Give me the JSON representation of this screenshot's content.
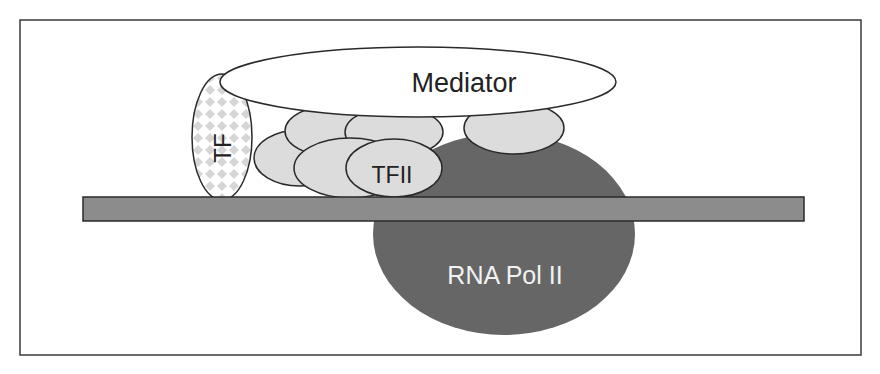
{
  "diagram": {
    "labels": {
      "mediator": "Mediator",
      "tf": "TF",
      "tfii": "TFII",
      "pol2": "RNA Pol II"
    },
    "colors": {
      "frame": "#3a3a3a",
      "pol2_fill": "#666666",
      "dna_fill": "#8c8c8c",
      "tfii_fill": "#dcdcdc",
      "mediator_fill": "#ffffff",
      "tf_pattern": "#d2d2d2",
      "outline": "#2a2a2a"
    }
  }
}
